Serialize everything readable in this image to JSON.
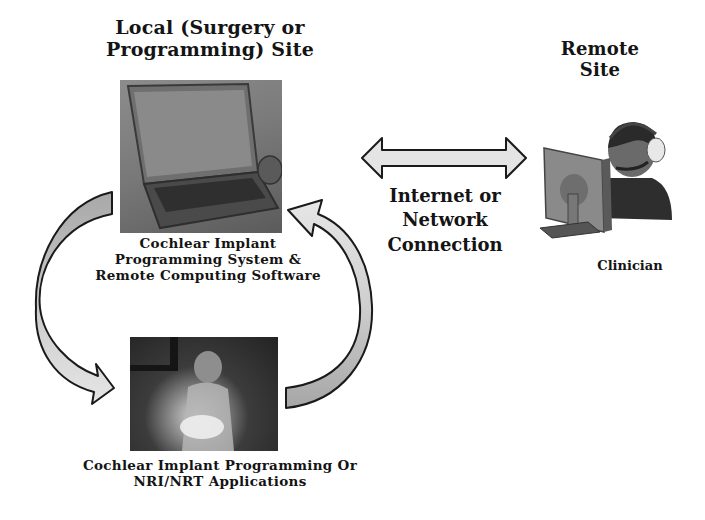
{
  "local_site": {
    "title_line1": "Local (Surgery or",
    "title_line2": "Programming) Site",
    "laptop_caption_line1": "Cochlear Implant",
    "laptop_caption_line2": "Programming System &",
    "laptop_caption_line3": "Remote Computing Software",
    "application_caption_line1": "Cochlear Implant Programming Or",
    "application_caption_line2": "NRI/NRT Applications",
    "images": {
      "laptop": "laptop-photo",
      "surgery": "surgery-photo"
    }
  },
  "connection": {
    "label_line1": "Internet or",
    "label_line2": "Network",
    "label_line3": "Connection",
    "arrow": "double-headed-arrow"
  },
  "remote_site": {
    "title_line1": "Remote",
    "title_line2": "Site",
    "clinician_label": "Clinician",
    "icon": "clinician-with-headset-and-monitor"
  },
  "cycle_arrows": {
    "left": "curved-arrow-down",
    "right": "curved-arrow-up"
  },
  "colors": {
    "arrow_fill_light": "#e6e6e6",
    "arrow_fill_dark": "#a8a8a8",
    "outline": "#1a1a1a",
    "text": "#141414"
  }
}
